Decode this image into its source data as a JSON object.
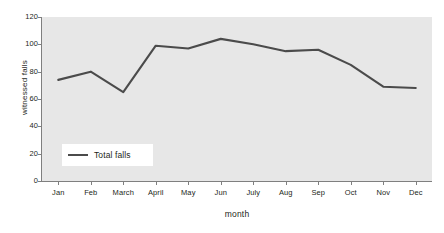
{
  "chart_data": {
    "type": "line",
    "title": "",
    "subtitle": "",
    "xlabel": "month",
    "ylabel": "witnessed falls",
    "categories": [
      "Jan",
      "Feb",
      "March",
      "April",
      "May",
      "Jun",
      "July",
      "Aug",
      "Sep",
      "Oct",
      "Nov",
      "Dec"
    ],
    "series": [
      {
        "name": "Total falls",
        "values": [
          74,
          80,
          65,
          99,
          97,
          104,
          100,
          95,
          96,
          85,
          69,
          68
        ],
        "color": "#4b4b4b"
      }
    ],
    "ylim": [
      0,
      120
    ],
    "y_ticks": [
      0,
      20,
      40,
      60,
      80,
      100,
      120
    ],
    "y_tick_labels": [
      "0",
      "20",
      "40",
      "60",
      "80",
      "100",
      "120"
    ],
    "grid": false,
    "legend_position": "inside-lower-left",
    "plot_background": "#e7e7e7",
    "figure_background": "#ffffff",
    "axis_color": "#7f7f7f",
    "text_color": "#231f20"
  },
  "legend": {
    "entries": [
      {
        "label": "Total falls",
        "color": "#4b4b4b"
      }
    ]
  }
}
